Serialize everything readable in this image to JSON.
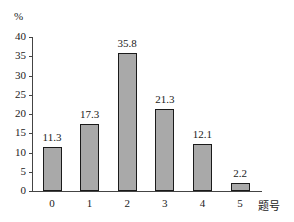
{
  "chart_data": {
    "type": "bar",
    "title": "",
    "xlabel": "题号",
    "ylabel": "%",
    "ylim": [
      0,
      40
    ],
    "yticks": [
      0,
      5,
      10,
      15,
      20,
      25,
      30,
      35,
      40
    ],
    "grid": false,
    "legend": null,
    "categories": [
      "0",
      "1",
      "2",
      "3",
      "4",
      "5"
    ],
    "values": [
      11.3,
      17.3,
      35.8,
      21.3,
      12.1,
      2.2
    ],
    "value_labels": [
      "11.3",
      "17.3",
      "35.8",
      "21.3",
      "12.1",
      "2.2"
    ],
    "bar_color": "#a9a9a9",
    "bar_edge_color": "#1a1a1a"
  }
}
